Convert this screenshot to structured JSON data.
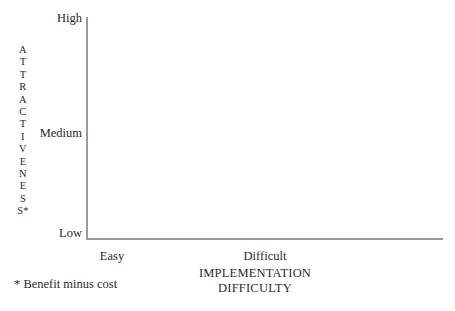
{
  "chart_data": {
    "type": "scatter",
    "title": "",
    "subtitle": "",
    "xlabel_lines": [
      "IMPLEMENTATION",
      "DIFFICULTY"
    ],
    "ylabel_letters": [
      "A",
      "T",
      "T",
      "R",
      "A",
      "C",
      "T",
      "I",
      "V",
      "E",
      "N",
      "E",
      "S",
      "S*"
    ],
    "ylabel_text": "ATTRACTIVENESS*",
    "x_ticks": [
      "Easy",
      "Difficult"
    ],
    "y_ticks": [
      "High",
      "Medium",
      "Low"
    ],
    "x": [],
    "y": [],
    "series": [],
    "grid": false,
    "legend": false,
    "legend_position": "none",
    "annotations": [
      {
        "id": "footnote",
        "text": "* Benefit minus cost"
      }
    ],
    "axis_color": "#9a9a9a",
    "text_color": "#2b2b2b",
    "background_color": "#ffffff"
  },
  "axes": {
    "y_ticks": {
      "high": "High",
      "medium": "Medium",
      "low": "Low"
    },
    "x_ticks": {
      "easy": "Easy",
      "difficult": "Difficult"
    },
    "x_title": {
      "line1": "IMPLEMENTATION",
      "line2": "DIFFICULTY"
    },
    "y_title": {
      "l01": "A",
      "l02": "T",
      "l03": "T",
      "l04": "R",
      "l05": "A",
      "l06": "C",
      "l07": "T",
      "l08": "I",
      "l09": "V",
      "l10": "E",
      "l11": "N",
      "l12": "E",
      "l13": "S",
      "l14": "S*"
    }
  },
  "footnote": {
    "text": "* Benefit minus cost"
  }
}
